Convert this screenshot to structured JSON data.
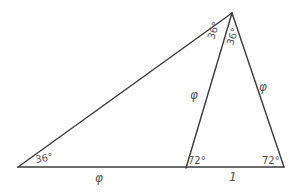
{
  "diagram": {
    "vertices": {
      "apex": {
        "x": 232,
        "y": 13
      },
      "left": {
        "x": 18,
        "y": 167
      },
      "foot": {
        "x": 186,
        "y": 167
      },
      "right": {
        "x": 284,
        "y": 167
      }
    },
    "angles": {
      "apex_left": "36°",
      "apex_right": "36°",
      "left_base": "36°",
      "foot": "72°",
      "right_base": "72°"
    },
    "sides": {
      "base_left": "φ",
      "base_right": "1",
      "inner_segment": "φ",
      "right_side": "φ"
    },
    "colors": {
      "stroke": "#3a3a3a",
      "text": "#555555",
      "background": "#ffffff"
    }
  }
}
